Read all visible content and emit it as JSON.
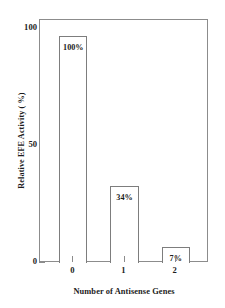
{
  "chart_data": {
    "type": "bar",
    "title": "",
    "xlabel": "Number of Antisense Genes",
    "ylabel": "Relative EFE Activity ( %)",
    "categories": [
      "0",
      "1",
      "2"
    ],
    "values": [
      100,
      34,
      7
    ],
    "value_labels": [
      "100%",
      "34%",
      "7%"
    ],
    "ylim": [
      0,
      107
    ],
    "xlim": [
      -0.65,
      2.65
    ],
    "yticks": [
      0,
      50,
      100
    ],
    "ytick_labels": [
      "0",
      "50",
      "100"
    ],
    "xtick_labels": [
      "0",
      "1",
      "2"
    ],
    "grid": false,
    "legend": null,
    "series": [
      {
        "name": "Relative EFE Activity",
        "values": [
          100,
          34,
          7
        ]
      }
    ],
    "style": {
      "bar_fill": "#ffffff",
      "bar_edge": "#7d7d7d",
      "axis_color": "#8c8c8c",
      "text_color": "#1c1c1c",
      "background": "#ffffff"
    }
  }
}
